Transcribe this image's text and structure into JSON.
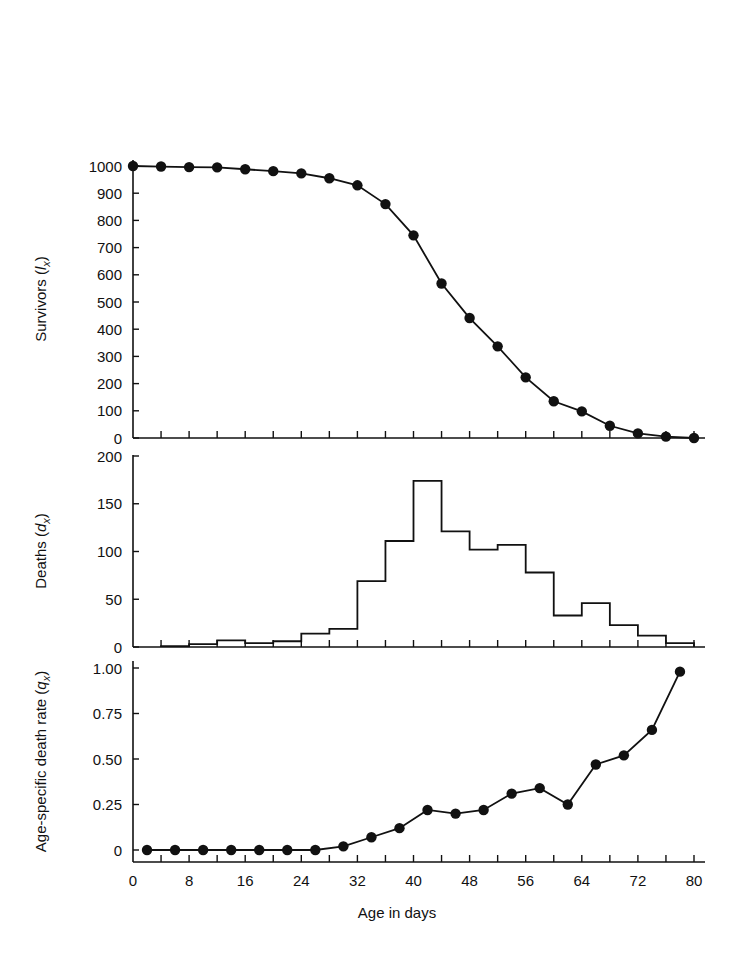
{
  "chart_data": [
    {
      "type": "line",
      "panel": "top",
      "title": "",
      "ylabel": "Survivors (l_x)",
      "ylabel_main": "Survivors (",
      "ylabel_sym": "l",
      "ylabel_sub": "x",
      "ylabel_close": ")",
      "xlabel": "",
      "ylim": [
        0,
        1000
      ],
      "yticks": [
        0,
        100,
        200,
        300,
        400,
        500,
        600,
        700,
        800,
        900,
        1000
      ],
      "ytick_labels": [
        "0",
        "100",
        "200",
        "300",
        "400",
        "500",
        "600",
        "700",
        "800",
        "900",
        "1000"
      ],
      "xlim": [
        0,
        80
      ],
      "x": [
        0,
        4,
        8,
        12,
        16,
        20,
        24,
        28,
        32,
        36,
        40,
        44,
        48,
        52,
        56,
        60,
        64,
        68,
        72,
        76,
        80
      ],
      "series": [
        {
          "name": "Survivors (l_x)",
          "values": [
            1000,
            998,
            996,
            995,
            988,
            981,
            973,
            955,
            929,
            860,
            745,
            568,
            441,
            337,
            223,
            135,
            98,
            45,
            17,
            5,
            0
          ]
        }
      ],
      "grid": false,
      "markers": "filled-circle"
    },
    {
      "type": "bar",
      "style": "step-histogram",
      "panel": "middle",
      "title": "",
      "ylabel": "Deaths (d_x)",
      "ylabel_main": "Deaths (",
      "ylabel_sym": "d",
      "ylabel_sub": "x",
      "ylabel_close": ")",
      "xlabel": "",
      "ylim": [
        0,
        200
      ],
      "yticks": [
        0,
        50,
        100,
        150,
        200
      ],
      "ytick_labels": [
        "0",
        "50",
        "100",
        "150",
        "200"
      ],
      "xlim": [
        0,
        80
      ],
      "bin_edges": [
        4,
        8,
        12,
        16,
        20,
        24,
        28,
        32,
        36,
        40,
        44,
        48,
        52,
        56,
        60,
        64,
        68,
        72,
        76,
        80
      ],
      "categories": [
        "4-8",
        "8-12",
        "12-16",
        "16-20",
        "20-24",
        "24-28",
        "28-32",
        "32-36",
        "36-40",
        "40-44",
        "44-48",
        "48-52",
        "52-56",
        "56-60",
        "60-64",
        "64-68",
        "68-72",
        "72-76",
        "76-80"
      ],
      "values": [
        1,
        3,
        7,
        4,
        6,
        14,
        19,
        69,
        111,
        174,
        121,
        102,
        107,
        78,
        33,
        46,
        23,
        12,
        4
      ],
      "grid": false
    },
    {
      "type": "line",
      "panel": "bottom",
      "title": "",
      "ylabel": "Age-specific death rate (q_x)",
      "ylabel_main": "Age-specific death rate (",
      "ylabel_sym": "q",
      "ylabel_sub": "x",
      "ylabel_close": ")",
      "xlabel": "Age in days",
      "ylim": [
        0,
        1.0
      ],
      "yticks": [
        0,
        0.25,
        0.5,
        0.75,
        1.0
      ],
      "ytick_labels": [
        "0",
        "0.25",
        "0.50",
        "0.75",
        "1.00"
      ],
      "xlim": [
        0,
        80
      ],
      "xticks": [
        0,
        8,
        16,
        24,
        32,
        40,
        48,
        56,
        64,
        72,
        80
      ],
      "xtick_labels": [
        "0",
        "8",
        "16",
        "24",
        "32",
        "40",
        "48",
        "56",
        "64",
        "72",
        "80"
      ],
      "x": [
        2,
        6,
        10,
        14,
        18,
        22,
        26,
        30,
        34,
        38,
        42,
        46,
        50,
        54,
        58,
        62,
        66,
        70,
        74,
        78
      ],
      "series": [
        {
          "name": "Age-specific death rate (q_x)",
          "values": [
            0,
            0,
            0,
            0,
            0,
            0,
            0,
            0.02,
            0.07,
            0.12,
            0.22,
            0.2,
            0.22,
            0.31,
            0.34,
            0.25,
            0.47,
            0.52,
            0.66,
            0.98
          ]
        }
      ],
      "grid": false,
      "markers": "filled-circle"
    }
  ],
  "colors": {
    "ink": "#111111",
    "background": "#ffffff"
  }
}
